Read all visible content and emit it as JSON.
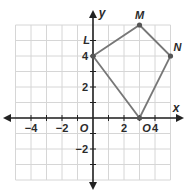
{
  "diagram": {
    "type": "coordinate-plane",
    "x_axis_label": "x",
    "y_axis_label": "y",
    "origin_label": "O",
    "x_range": [
      -5,
      5
    ],
    "y_range": [
      -4,
      6
    ],
    "x_tick_labels": [
      {
        "value": -4,
        "text": "−4"
      },
      {
        "value": -2,
        "text": "−2"
      },
      {
        "value": 2,
        "text": "2"
      },
      {
        "value": 4,
        "text": "4"
      }
    ],
    "y_tick_labels": [
      {
        "value": 4,
        "text": "4"
      },
      {
        "value": 2,
        "text": "2"
      },
      {
        "value": -2,
        "text": "−2"
      }
    ],
    "polygon": {
      "name": "LMNO",
      "vertices": [
        {
          "label": "L",
          "x": 0,
          "y": 4
        },
        {
          "label": "M",
          "x": 3,
          "y": 6
        },
        {
          "label": "N",
          "x": 5,
          "y": 4
        },
        {
          "label": "O",
          "x": 3,
          "y": 0
        }
      ],
      "edge_color": "#777777",
      "point_color": "#555555"
    },
    "colors": {
      "grid": "#d6d6d6",
      "axis": "#222222"
    }
  }
}
